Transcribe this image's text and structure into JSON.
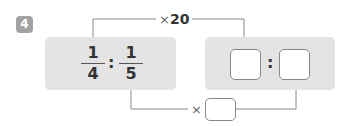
{
  "problem": {
    "number": "4",
    "left_ratio": {
      "first": {
        "numerator": "1",
        "denominator": "4"
      },
      "separator": ":",
      "second": {
        "numerator": "1",
        "denominator": "5"
      }
    },
    "right_ratio": {
      "first": "",
      "separator": ":",
      "second": ""
    },
    "top_operation": {
      "symbol": "×",
      "value": "20"
    },
    "bottom_operation": {
      "symbol": "×",
      "value": ""
    }
  },
  "colors": {
    "badge": "#a3a3a3",
    "panel": "#e2e2e2",
    "line": "#777777"
  }
}
